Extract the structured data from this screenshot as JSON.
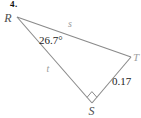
{
  "problem_number": "4.",
  "diagram": {
    "type": "right-triangle",
    "vertices": {
      "R": "R",
      "T": "T",
      "S": "S"
    },
    "angle_at_R": "26.7°",
    "side_RT_label": "s",
    "side_RS_label": "t",
    "side_ST_label": "0.17",
    "right_angle_vertex": "S"
  },
  "colors": {
    "line": "#8a8a8a",
    "dark_text": "#1c1c1c",
    "vertex_text": "#4d4d4d",
    "light_text": "#9a9a9a",
    "background": "#ffffff"
  }
}
